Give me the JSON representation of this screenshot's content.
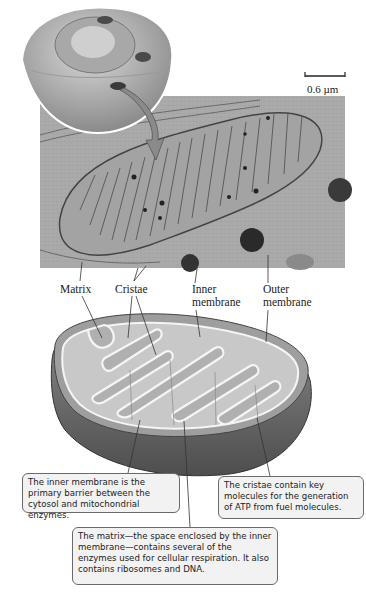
{
  "figure": {
    "scale_bar": {
      "label": "0.6 µm"
    },
    "labels": {
      "matrix": "Matrix",
      "cristae": "Cristae",
      "inner_membrane_line1": "Inner",
      "inner_membrane_line2": "membrane",
      "outer_membrane_line1": "Outer",
      "outer_membrane_line2": "membrane"
    },
    "callouts": {
      "inner_membrane": "The inner membrane is the primary barrier between the cytosol and mitochondrial enzymes.",
      "cristae": "The cristae contain key molecules for the generation of ATP from fuel molecules.",
      "matrix": "The matrix—the space enclosed by the inner membrane—contains several of the enzymes used  for cellular respiration. It also contains ribosomes and DNA."
    },
    "colors": {
      "outer_shell": "#6e6e6e",
      "inner_fill": "#bdbdbd",
      "callout_bg": "#f2f2f2",
      "micrograph": "#a9a9a9"
    }
  }
}
